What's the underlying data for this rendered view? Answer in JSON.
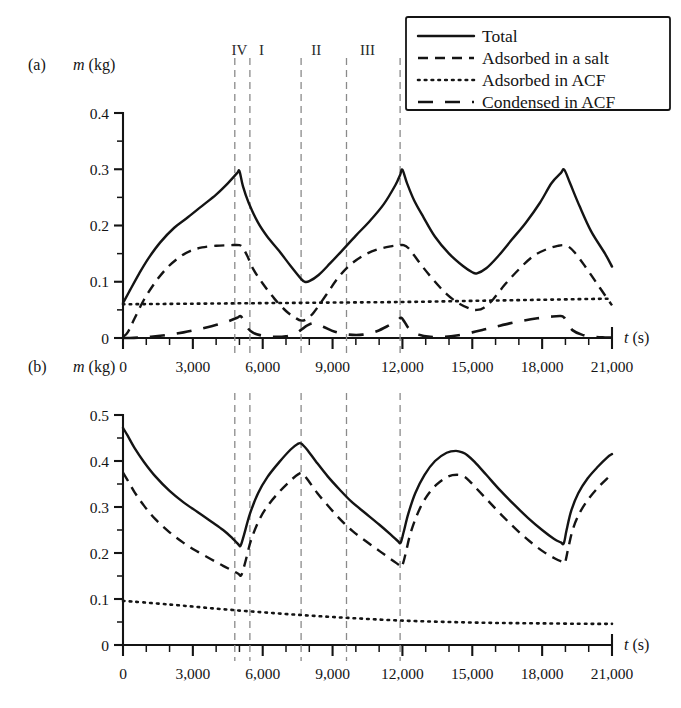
{
  "figure": {
    "legend": {
      "entries": [
        {
          "label": "Total",
          "style": "solid"
        },
        {
          "label": "Adsorbed in a salt",
          "style": "dashed"
        },
        {
          "label": "Adsorbed in ACF",
          "style": "dotted"
        },
        {
          "label": "Condensed in ACF",
          "style": "longdash"
        }
      ]
    },
    "region_labels": [
      {
        "text": "IV",
        "t": 5000
      },
      {
        "text": "I",
        "t": 5950
      },
      {
        "text": "II",
        "t": 8300
      },
      {
        "text": "III",
        "t": 10500
      }
    ],
    "divider_lines_t": [
      4800,
      5450,
      7650,
      9600,
      11900
    ]
  },
  "chart_data": [
    {
      "type": "line",
      "panel": "a",
      "panel_label": "(a)",
      "title": "",
      "xlabel": "t (s)",
      "ylabel": "m (kg)",
      "xlim": [
        0,
        21000
      ],
      "ylim": [
        0,
        0.4
      ],
      "xticks": [
        0,
        3000,
        6000,
        9000,
        12000,
        15000,
        18000,
        21000
      ],
      "xticklabels": [
        "0",
        "3,000",
        "6,000",
        "9,000",
        "12,000",
        "15,000",
        "18,000",
        "21,000"
      ],
      "xminor_step": 1000,
      "yticks": [
        0,
        0.1,
        0.2,
        0.3,
        0.4
      ],
      "yticklabels": [
        "0",
        "0.1",
        "0.2",
        "0.3",
        "0.4"
      ],
      "yminor_step": 0.05,
      "grid": false,
      "legend_position": "top-right-outside",
      "series": [
        {
          "name": "Total",
          "style": "solid",
          "x": [
            0,
            300,
            700,
            1100,
            1600,
            2200,
            2800,
            3400,
            4000,
            4500,
            4900,
            5000,
            5150,
            5400,
            5800,
            6200,
            6700,
            7200,
            7650,
            7800,
            8000,
            8400,
            8900,
            9400,
            10000,
            10600,
            11200,
            11700,
            11900,
            12000,
            12200,
            12500,
            12900,
            13400,
            14000,
            14600,
            15000,
            15200,
            15600,
            16100,
            16700,
            17300,
            17900,
            18400,
            18800,
            18950,
            19200,
            19600,
            20100,
            20700,
            21000
          ],
          "y": [
            0.062,
            0.085,
            0.115,
            0.142,
            0.17,
            0.196,
            0.215,
            0.235,
            0.255,
            0.275,
            0.293,
            0.297,
            0.27,
            0.24,
            0.205,
            0.18,
            0.155,
            0.128,
            0.105,
            0.1,
            0.101,
            0.112,
            0.133,
            0.155,
            0.182,
            0.208,
            0.238,
            0.272,
            0.29,
            0.299,
            0.275,
            0.245,
            0.215,
            0.18,
            0.15,
            0.128,
            0.117,
            0.115,
            0.124,
            0.145,
            0.175,
            0.205,
            0.24,
            0.275,
            0.293,
            0.299,
            0.275,
            0.235,
            0.19,
            0.15,
            0.127
          ]
        },
        {
          "name": "Adsorbed in a salt",
          "style": "dashed",
          "x": [
            0,
            200,
            500,
            900,
            1400,
            1900,
            2400,
            2900,
            3400,
            4000,
            4600,
            5000,
            5150,
            5350,
            5600,
            6000,
            6500,
            7000,
            7400,
            7650,
            7900,
            8200,
            8700,
            9200,
            9700,
            10300,
            10900,
            11500,
            11900,
            12050,
            12250,
            12500,
            12900,
            13400,
            13900,
            14400,
            14900,
            15200,
            15500,
            15900,
            16400,
            17000,
            17600,
            18200,
            18700,
            18950,
            19150,
            19400,
            19800,
            20300,
            20800,
            21000
          ],
          "y": [
            0.002,
            0.01,
            0.035,
            0.068,
            0.1,
            0.125,
            0.143,
            0.155,
            0.161,
            0.164,
            0.165,
            0.165,
            0.16,
            0.145,
            0.122,
            0.097,
            0.07,
            0.048,
            0.036,
            0.031,
            0.034,
            0.046,
            0.075,
            0.105,
            0.128,
            0.146,
            0.157,
            0.163,
            0.165,
            0.165,
            0.16,
            0.147,
            0.125,
            0.1,
            0.078,
            0.062,
            0.052,
            0.05,
            0.054,
            0.069,
            0.095,
            0.122,
            0.145,
            0.158,
            0.164,
            0.165,
            0.162,
            0.152,
            0.13,
            0.1,
            0.07,
            0.058
          ]
        },
        {
          "name": "Adsorbed in ACF",
          "style": "dotted",
          "x": [
            0,
            3000,
            6000,
            9000,
            12000,
            15000,
            18000,
            21000
          ],
          "y": [
            0.06,
            0.061,
            0.062,
            0.063,
            0.064,
            0.066,
            0.068,
            0.07
          ]
        },
        {
          "name": "Condensed in ACF",
          "style": "longdash",
          "x": [
            0,
            300,
            800,
            1400,
            2000,
            2600,
            3200,
            3800,
            4400,
            4900,
            5050,
            5200,
            5350,
            5600,
            6000,
            6500,
            7000,
            7400,
            7700,
            7900,
            8200,
            8600,
            9100,
            9700,
            10300,
            10900,
            11400,
            11800,
            11950,
            12100,
            12300,
            12700,
            13200,
            13800,
            14400,
            15000,
            15500,
            16000,
            16600,
            17200,
            17800,
            18400,
            18800,
            18950,
            19100,
            19300,
            19700,
            20200,
            20700,
            21000
          ],
          "y": [
            0.0,
            0.0,
            0.001,
            0.003,
            0.006,
            0.01,
            0.015,
            0.021,
            0.028,
            0.036,
            0.039,
            0.03,
            0.018,
            0.009,
            0.004,
            0.002,
            0.003,
            0.008,
            0.016,
            0.022,
            0.026,
            0.02,
            0.011,
            0.006,
            0.006,
            0.012,
            0.022,
            0.032,
            0.036,
            0.028,
            0.016,
            0.006,
            0.002,
            0.002,
            0.005,
            0.01,
            0.015,
            0.02,
            0.026,
            0.031,
            0.035,
            0.038,
            0.039,
            0.036,
            0.026,
            0.014,
            0.006,
            0.002,
            0.001,
            0.001
          ]
        }
      ]
    },
    {
      "type": "line",
      "panel": "b",
      "panel_label": "(b)",
      "title": "",
      "xlabel": "t (s)",
      "ylabel": "m (kg)",
      "xlim": [
        0,
        21000
      ],
      "ylim": [
        0,
        0.5
      ],
      "xticks": [
        0,
        3000,
        6000,
        9000,
        12000,
        15000,
        18000,
        21000
      ],
      "xticklabels": [
        "0",
        "3,000",
        "6,000",
        "9,000",
        "12,000",
        "15,000",
        "18,000",
        "21,000"
      ],
      "xminor_step": 1000,
      "yticks": [
        0,
        0.1,
        0.2,
        0.3,
        0.4,
        0.5
      ],
      "yticklabels": [
        "0",
        "0.1",
        "0.2",
        "0.3",
        "0.4",
        "0.5"
      ],
      "yminor_step": 0.05,
      "grid": false,
      "legend_position": "none",
      "series": [
        {
          "name": "Total",
          "style": "solid",
          "x": [
            0,
            200,
            500,
            900,
            1400,
            2000,
            2600,
            3200,
            3800,
            4300,
            4700,
            4950,
            5050,
            5200,
            5450,
            5800,
            6200,
            6700,
            7200,
            7500,
            7650,
            7900,
            8300,
            8800,
            9300,
            9800,
            10400,
            11000,
            11500,
            11800,
            11920,
            12050,
            12250,
            12550,
            12950,
            13400,
            13900,
            14300,
            14600,
            14800,
            15100,
            15600,
            16200,
            16800,
            17400,
            18000,
            18500,
            18800,
            18930,
            19050,
            19250,
            19550,
            19950,
            20400,
            20800,
            21000
          ],
          "y": [
            0.472,
            0.455,
            0.428,
            0.398,
            0.366,
            0.335,
            0.31,
            0.289,
            0.268,
            0.25,
            0.232,
            0.219,
            0.216,
            0.24,
            0.285,
            0.33,
            0.365,
            0.397,
            0.425,
            0.437,
            0.438,
            0.425,
            0.398,
            0.366,
            0.338,
            0.312,
            0.287,
            0.262,
            0.24,
            0.226,
            0.222,
            0.245,
            0.285,
            0.33,
            0.37,
            0.4,
            0.418,
            0.422,
            0.418,
            0.412,
            0.398,
            0.37,
            0.336,
            0.305,
            0.276,
            0.25,
            0.231,
            0.223,
            0.221,
            0.25,
            0.292,
            0.33,
            0.362,
            0.388,
            0.408,
            0.415
          ]
        },
        {
          "name": "Adsorbed in a salt",
          "style": "dashed",
          "x": [
            0,
            200,
            500,
            900,
            1400,
            2000,
            2600,
            3200,
            3800,
            4300,
            4700,
            4950,
            5080,
            5250,
            5500,
            5850,
            6250,
            6750,
            7250,
            7550,
            7700,
            7950,
            8350,
            8850,
            9350,
            9850,
            10450,
            11050,
            11550,
            11850,
            11970,
            12120,
            12320,
            12620,
            13000,
            13450,
            13950,
            14350,
            14650,
            14850,
            15150,
            15650,
            16250,
            16850,
            17450,
            18050,
            18550,
            18850,
            18980,
            19120,
            19320,
            19620,
            20000,
            20450,
            20850,
            21000
          ],
          "y": [
            0.375,
            0.358,
            0.332,
            0.303,
            0.273,
            0.245,
            0.222,
            0.203,
            0.186,
            0.172,
            0.162,
            0.155,
            0.152,
            0.18,
            0.228,
            0.272,
            0.305,
            0.335,
            0.36,
            0.372,
            0.373,
            0.358,
            0.33,
            0.3,
            0.272,
            0.248,
            0.225,
            0.203,
            0.185,
            0.174,
            0.17,
            0.195,
            0.238,
            0.282,
            0.32,
            0.348,
            0.366,
            0.37,
            0.366,
            0.358,
            0.342,
            0.315,
            0.283,
            0.253,
            0.226,
            0.203,
            0.188,
            0.181,
            0.179,
            0.21,
            0.252,
            0.288,
            0.318,
            0.345,
            0.365,
            0.372
          ]
        },
        {
          "name": "Adsorbed in ACF",
          "style": "dotted",
          "x": [
            0,
            2000,
            4000,
            6000,
            8000,
            10000,
            12000,
            14000,
            16000,
            18000,
            20000,
            21000
          ],
          "y": [
            0.096,
            0.088,
            0.079,
            0.071,
            0.064,
            0.058,
            0.053,
            0.05,
            0.048,
            0.047,
            0.046,
            0.046
          ]
        }
      ]
    }
  ]
}
